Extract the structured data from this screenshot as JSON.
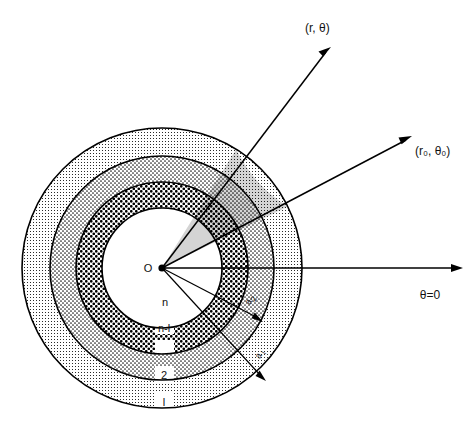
{
  "figure": {
    "kind": "polar-coordinate-concentric-layers-diagram",
    "background_color": "#ffffff",
    "ink_color": "#000000",
    "center_label": "O",
    "origin": {
      "x": 162,
      "y": 268
    },
    "outer_radius": 140
  },
  "labels": {
    "field_point": "(r, θ)",
    "source_point": "(r₀, θ₀)",
    "reference_axis": "θ=0",
    "origin": "O",
    "layer_n": "n",
    "layer_n_minus_1": "n-l",
    "layer_2": "2",
    "layer_1": "l",
    "radius_a2": "a",
    "radius_a2_sub": "2",
    "radius_a1": "a",
    "radius_a1_sub": "l"
  },
  "layers": [
    {
      "name": "layer-1-outermost",
      "label": "l",
      "inner_radius": 112,
      "outer_radius": 140,
      "pattern": "fine-dot-light",
      "label_position": {
        "x": 164,
        "y": 403
      }
    },
    {
      "name": "layer-2",
      "label": "2",
      "inner_radius": 86,
      "outer_radius": 112,
      "pattern": "medium-dot",
      "label_position": {
        "x": 164,
        "y": 375
      }
    },
    {
      "name": "layer-n-minus-1",
      "label": "n-l",
      "inner_radius": 60,
      "outer_radius": 86,
      "pattern": "coarse-dot-dark",
      "label_position": {
        "x": 164,
        "y": 330
      }
    },
    {
      "name": "layer-n-core",
      "label": "n",
      "inner_radius": 0,
      "outer_radius": 60,
      "pattern": "none-white",
      "label_position": {
        "x": 165,
        "y": 303
      }
    }
  ],
  "rays": [
    {
      "name": "ray-field-point",
      "label": "(r, θ)",
      "angle_degrees": 58,
      "label_position": {
        "x": 305,
        "y": 32
      },
      "tip": {
        "x": 331,
        "y": 47
      },
      "has_arrowhead": true
    },
    {
      "name": "ray-source-point",
      "label": "(r₀, θ₀)",
      "angle_degrees": 26,
      "label_position": {
        "x": 418,
        "y": 152
      },
      "tip": {
        "x": 412,
        "y": 136
      },
      "has_arrowhead": true
    },
    {
      "name": "ray-reference-axis",
      "label": "θ=0",
      "angle_degrees": 0,
      "label_position": {
        "x": 428,
        "y": 297
      },
      "tip": {
        "x": 463,
        "y": 268
      },
      "has_arrowhead": true
    },
    {
      "name": "ray-radius-a2",
      "label": "a₂",
      "angle_degrees": -32,
      "label_position": {
        "x": 250,
        "y": 300
      },
      "tip": {
        "x": 262,
        "y": 322
      },
      "has_arrowhead": true
    },
    {
      "name": "ray-radius-a1",
      "label": "a₁",
      "angle_degrees": -38,
      "label_position": {
        "x": 262,
        "y": 354
      },
      "tip": {
        "x": 266,
        "y": 381
      },
      "has_arrowhead": true
    }
  ],
  "sector": {
    "name": "shaded-sector-between-rays",
    "start_angle_degrees": 26,
    "end_angle_degrees": 58,
    "shading": "darker-overlay"
  }
}
